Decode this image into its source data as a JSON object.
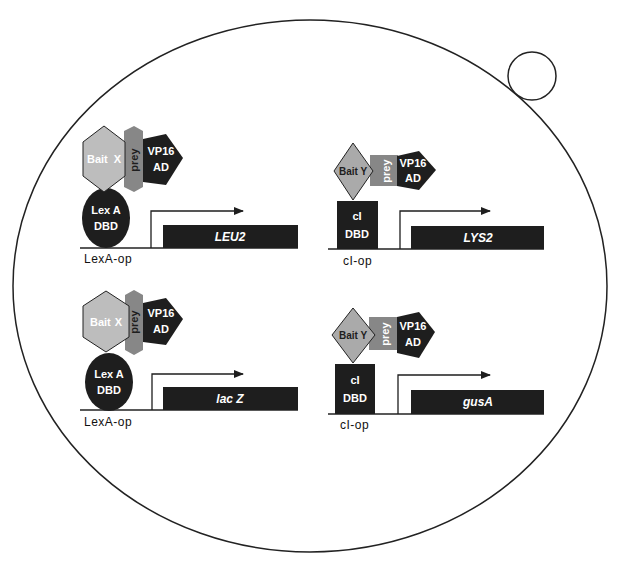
{
  "diagram": {
    "type": "yeast two-hybrid dual bait reporter system",
    "cell": {
      "shape": "ellipse",
      "bud": "small circle"
    },
    "colors": {
      "outline": "#222222",
      "dark_fill": "#1e1e1e",
      "bait_x_fill": "#bdbdbd",
      "bait_y_fill": "#aaaaaa",
      "prey_fill": "#878787",
      "background": "#ffffff"
    },
    "constructs": [
      {
        "id": "top-left",
        "bait": {
          "label_1": "Bait",
          "label_2": "X",
          "shape": "hexagon"
        },
        "prey": {
          "label": "prey"
        },
        "activation": {
          "label_1": "VP16",
          "label_2": "AD",
          "shape": "pentagon"
        },
        "dbd": {
          "label_1": "Lex A",
          "label_2": "DBD",
          "shape": "circle"
        },
        "operator": "LexA-op",
        "reporter": "LEU2"
      },
      {
        "id": "top-right",
        "bait": {
          "label": "Bait Y",
          "shape": "diamond"
        },
        "prey": {
          "label": "prey"
        },
        "activation": {
          "label_1": "VP16",
          "label_2": "AD",
          "shape": "pentagon"
        },
        "dbd": {
          "label_1": "cI",
          "label_2": "DBD",
          "shape": "square"
        },
        "operator": "cI-op",
        "reporter": "LYS2"
      },
      {
        "id": "bottom-left",
        "bait": {
          "label_1": "Bait",
          "label_2": "X",
          "shape": "hexagon"
        },
        "prey": {
          "label": "prey"
        },
        "activation": {
          "label_1": "VP16",
          "label_2": "AD",
          "shape": "pentagon"
        },
        "dbd": {
          "label_1": "Lex A",
          "label_2": "DBD",
          "shape": "circle"
        },
        "operator": "LexA-op",
        "reporter": "lac Z"
      },
      {
        "id": "bottom-right",
        "bait": {
          "label": "Bait Y",
          "shape": "diamond"
        },
        "prey": {
          "label": "prey"
        },
        "activation": {
          "label_1": "VP16",
          "label_2": "AD",
          "shape": "pentagon"
        },
        "dbd": {
          "label_1": "cI",
          "label_2": "DBD",
          "shape": "square"
        },
        "operator": "cI-op",
        "reporter": "gusA"
      }
    ]
  }
}
